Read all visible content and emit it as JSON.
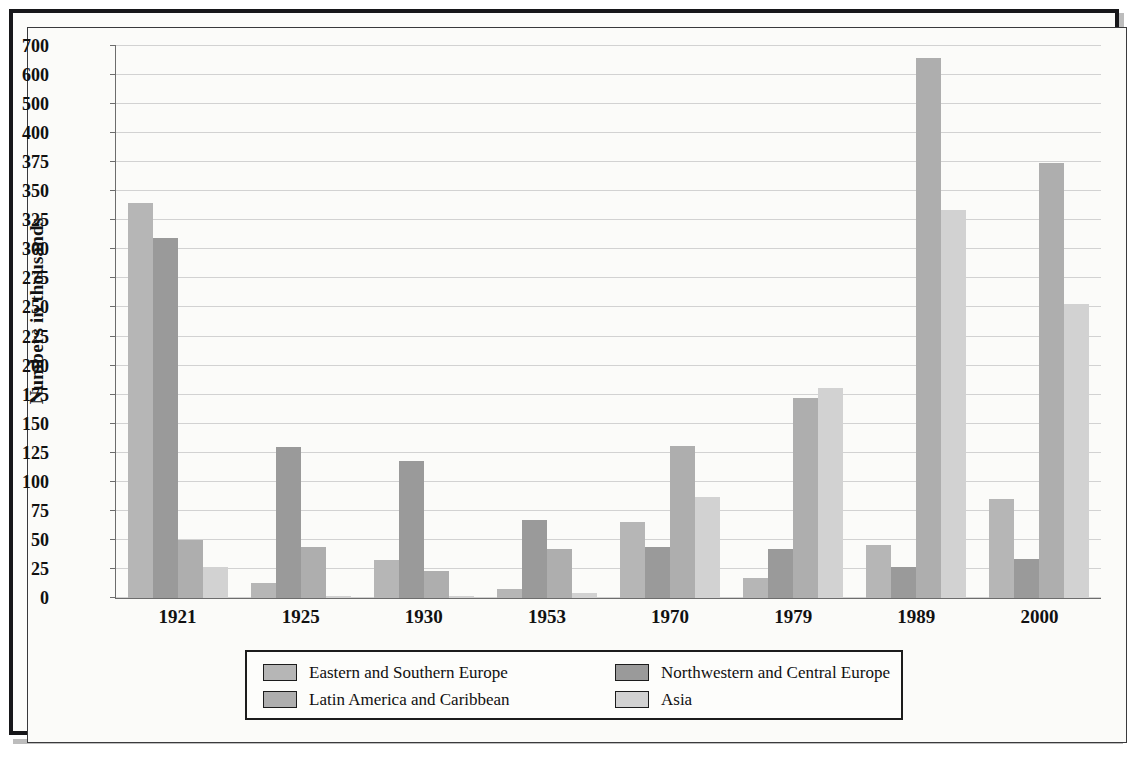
{
  "chart_data": {
    "type": "bar",
    "title": "",
    "subtitle": "",
    "xlabel": "",
    "ylabel": "Numbers in thousands",
    "grid": true,
    "legend_position": "bottom",
    "axis_note": "Y axis ticks are evenly spaced in pixels but non-linear in value: 0-375 in increments of 25, then 400, 500, 600, 700.",
    "ytick_labels": [
      "0",
      "25",
      "50",
      "75",
      "100",
      "125",
      "150",
      "175",
      "200",
      "225",
      "250",
      "275",
      "300",
      "325",
      "350",
      "375",
      "400",
      "500",
      "600",
      "700"
    ],
    "ylim": [
      0,
      700
    ],
    "categories": [
      "1921",
      "1925",
      "1930",
      "1953",
      "1970",
      "1979",
      "1989",
      "2000"
    ],
    "series": [
      {
        "name": "Eastern and Southern Europe",
        "color": "#b6b6b6",
        "values": [
          340,
          13,
          33,
          8,
          65,
          17,
          46,
          85
        ]
      },
      {
        "name": "Northwestern and Central Europe",
        "color": "#9a9a9a",
        "values": [
          310,
          130,
          118,
          67,
          44,
          42,
          27,
          34
        ]
      },
      {
        "name": "Latin America and Caribbean",
        "color": "#aeaeae",
        "values": [
          50,
          44,
          23,
          42,
          131,
          172,
          660,
          374
        ]
      },
      {
        "name": "Asia",
        "color": "#d2d2d2",
        "values": [
          27,
          2,
          2,
          4,
          87,
          181,
          334,
          253
        ]
      }
    ]
  },
  "legend": {
    "entries": [
      {
        "label": "Eastern and Southern Europe",
        "color": "#b6b6b6"
      },
      {
        "label": "Latin America and Caribbean",
        "color": "#aeaeae"
      },
      {
        "label": "Northwestern and Central Europe",
        "color": "#9a9a9a"
      },
      {
        "label": "Asia",
        "color": "#d2d2d2"
      }
    ]
  }
}
